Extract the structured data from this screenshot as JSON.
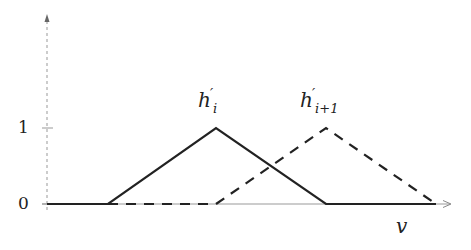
{
  "diagram": {
    "type": "membership-functions",
    "axes": {
      "x_label": "v",
      "y_ticks": [
        {
          "label": "0",
          "value": 0
        },
        {
          "label": "1",
          "value": 1
        }
      ]
    },
    "curves": [
      {
        "name": "h'_i",
        "label_base": "h",
        "label_sub": "i",
        "style": "solid",
        "points": [
          [
            0,
            0
          ],
          [
            1,
            0
          ],
          [
            2,
            1
          ],
          [
            3,
            0
          ],
          [
            4,
            0
          ]
        ]
      },
      {
        "name": "h'_{i+1}",
        "label_base": "h",
        "label_sub": "i+1",
        "style": "dashed",
        "points": [
          [
            1,
            0
          ],
          [
            2,
            0
          ],
          [
            3,
            1
          ],
          [
            4,
            0
          ]
        ]
      }
    ],
    "colors": {
      "line": "#222222",
      "axis": "#999999"
    }
  }
}
